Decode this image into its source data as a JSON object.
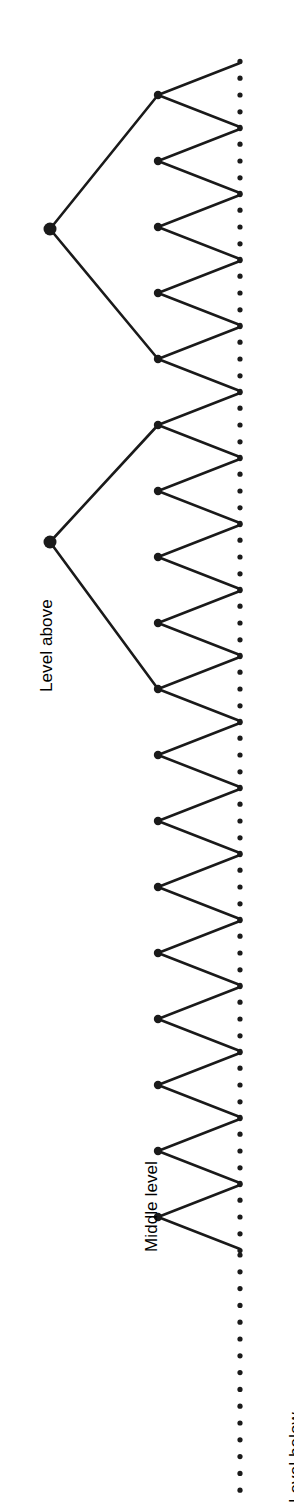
{
  "figure": {
    "type": "tree-diagram",
    "orientation": "rotated-90-ccw",
    "background_color": "#ffffff",
    "stroke_color": "#1a1a1a",
    "canvas": {
      "width": 294,
      "height": 1506
    }
  },
  "labels": {
    "level_above": "Level above",
    "middle_level": "Middle level",
    "level_below": "Level below"
  },
  "label_positions": {
    "level_above": {
      "x": 38,
      "y": 692,
      "rotation": -90
    },
    "middle_level": {
      "x": 143,
      "y": 1252,
      "rotation": -90
    },
    "level_below": {
      "x": 287,
      "y": 1503,
      "rotation": -90
    }
  },
  "geometry": {
    "node_radius": 6.5,
    "child_node_radius": 4.2,
    "parent_x": 50,
    "middle_x": 158,
    "leaf_x": 240,
    "v_spread": 32,
    "v_first_y": 95,
    "v_spacing": 66.2,
    "v_count": 16,
    "dot_radius": 2.6,
    "dot_spacing": 16.8,
    "dots_per_group": 5,
    "line_width": 2.6,
    "trailing_dots_start_y": 1255,
    "trailing_dots_end_y": 1504,
    "trailing_dot_spacing": 16.8
  },
  "parents": [
    {
      "name": "parent-node-1",
      "x": 50,
      "y": 229,
      "children_indices": [
        0,
        4
      ]
    },
    {
      "name": "parent-node-2",
      "x": 50,
      "y": 542,
      "children_indices": [
        5,
        9
      ]
    }
  ],
  "middle_nodes": [
    {
      "index": 0,
      "y": 95,
      "has_parent_link": true,
      "parent": 0
    },
    {
      "index": 1,
      "y": 161,
      "has_parent_link": false,
      "parent": null
    },
    {
      "index": 2,
      "y": 227,
      "has_parent_link": false,
      "parent": null
    },
    {
      "index": 3,
      "y": 293,
      "has_parent_link": false,
      "parent": null
    },
    {
      "index": 4,
      "y": 359,
      "has_parent_link": true,
      "parent": 0
    },
    {
      "index": 5,
      "y": 425,
      "has_parent_link": true,
      "parent": 1
    },
    {
      "index": 6,
      "y": 491,
      "has_parent_link": false,
      "parent": null
    },
    {
      "index": 7,
      "y": 557,
      "has_parent_link": false,
      "parent": null
    },
    {
      "index": 8,
      "y": 623,
      "has_parent_link": false,
      "parent": null
    },
    {
      "index": 9,
      "y": 689,
      "has_parent_link": true,
      "parent": 1
    },
    {
      "index": 10,
      "y": 755,
      "has_parent_link": false,
      "parent": null
    },
    {
      "index": 11,
      "y": 821,
      "has_parent_link": false,
      "parent": null
    },
    {
      "index": 12,
      "y": 887,
      "has_parent_link": false,
      "parent": null
    },
    {
      "index": 13,
      "y": 953,
      "has_parent_link": false,
      "parent": null
    },
    {
      "index": 14,
      "y": 1019,
      "has_parent_link": false,
      "parent": null
    },
    {
      "index": 15,
      "y": 1085,
      "has_parent_link": false,
      "parent": null
    },
    {
      "index": 16,
      "y": 1151,
      "has_parent_link": false,
      "parent": null
    },
    {
      "index": 17,
      "y": 1217,
      "has_parent_link": false,
      "parent": null
    }
  ]
}
